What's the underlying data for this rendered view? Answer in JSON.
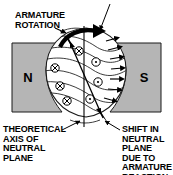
{
  "figure": {
    "title_cut_off": "RESULTANT ARMATURE FIELD",
    "background_color": "#ffffff",
    "pole_color": "#b5b5b5",
    "line_color": "#000000",
    "title_color": "#b02020"
  },
  "labels": {
    "armature_rotation": "ARMATURE\nROTATION",
    "theoretical_axis": "THEORETICAL\nAXIS OF\nNEUTRAL\nPLANE",
    "shift_neutral": "SHIFT IN\nNEUTRAL\nPLANE\nDUE TO\nARMATURE\nREACTION"
  },
  "poles": {
    "north": {
      "letter": "N",
      "name": "north-pole",
      "x": 28,
      "y": 82
    },
    "south": {
      "letter": "S",
      "name": "south-pole",
      "x": 144,
      "y": 82
    }
  },
  "conductors": {
    "into_page_symbol": "cross-in-circle",
    "out_of_page_symbol": "dot-in-circle",
    "into_page": [
      {
        "cx": 55,
        "cy": 68,
        "r": 4.2
      },
      {
        "cx": 60,
        "cy": 86,
        "r": 4.2
      },
      {
        "cx": 67,
        "cy": 101,
        "r": 4.2
      },
      {
        "cx": 79,
        "cy": 51,
        "r": 4.2
      }
    ],
    "out_of_page": [
      {
        "cx": 96,
        "cy": 62,
        "r": 4.2
      },
      {
        "cx": 98,
        "cy": 82,
        "r": 4.2
      },
      {
        "cx": 90,
        "cy": 99,
        "r": 4.2
      }
    ]
  },
  "axes": {
    "theoretical_neutral": {
      "name": "theoretical-neutral-axis",
      "x1": 84,
      "y1": 26,
      "x2": 84,
      "y2": 127,
      "style": "vertical-straight"
    },
    "shifted_neutral": {
      "name": "shifted-neutral-plane-axis",
      "x1": 68,
      "y1": 38,
      "x2": 103,
      "y2": 118,
      "style": "tilted-with-arrowheads"
    }
  },
  "rotation_arrow": {
    "name": "armature-rotation-arrow",
    "direction": "clockwise",
    "description": "thick curved double-headed arrow over top of armature"
  },
  "field_lines": {
    "count_left": 5,
    "count_right_arrows": 7,
    "description": "distorted flux lines bowed toward trailing pole tips"
  }
}
